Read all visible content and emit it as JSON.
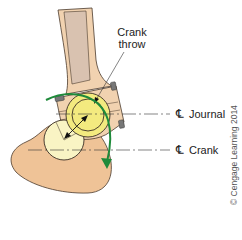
{
  "figure": {
    "labels": {
      "crank_throw_line1": "Crank",
      "crank_throw_line2": "throw",
      "centerline_symbol": "℄",
      "journal": "Journal",
      "crank": "Crank"
    },
    "copyright": "© Cengage Learning 2014",
    "colors": {
      "rod_body": "#f1d2b0",
      "rod_shank_inner": "#d9c2b0",
      "crank_web": "#efc397",
      "journal_fill": "#f3ea7f",
      "crank_pin_fill": "#f9f4c4",
      "rotation_arrow": "#1e8a3a",
      "bolt": "#777777",
      "outline": "#3a2e25"
    }
  }
}
